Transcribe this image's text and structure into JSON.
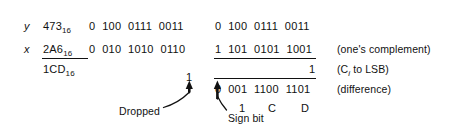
{
  "figure": {
    "operands": {
      "y_symbol": "y",
      "x_symbol": "x",
      "y_hex": "473",
      "x_hex": "2A6",
      "result_hex": "1CD",
      "hex_subscript": "16"
    },
    "column_left": {
      "row_y_bits": "0  100  0111  0011",
      "row_x_bits": "0  010  1010  0110"
    },
    "column_right": {
      "row_y_bits": "0  100  0111  0011",
      "row_complement_bits": "1  101  0101  1001",
      "row_carry_bit": "1",
      "row_difference_bits": "0  001  1100  1101"
    },
    "hex_digits_under_result": [
      "1",
      "C",
      "D"
    ],
    "dropped_carry_bit": "1",
    "annotations": {
      "ones_complement": "(one's complement)",
      "carry_to_lsb_prefix": "(C",
      "carry_to_lsb_sub": "i",
      "carry_to_lsb_suffix": " to LSB)",
      "difference": "(difference)",
      "dropped": "Dropped",
      "sign_bit": "Sign bit"
    },
    "colors": {
      "ink": "#111111",
      "background": "#ffffff"
    }
  }
}
